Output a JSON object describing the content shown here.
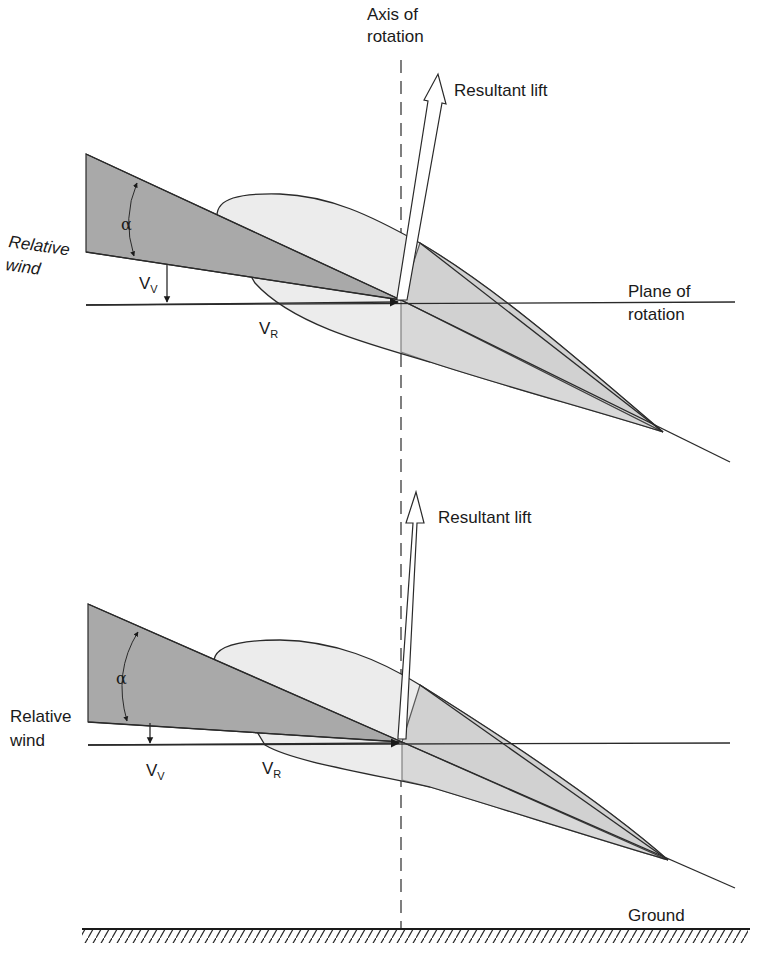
{
  "axis": {
    "label_line1": "Axis of",
    "label_line2": "rotation",
    "style": "dashed-vertical"
  },
  "top_diagram": {
    "lift_label": "Resultant lift",
    "relative_wind_line1": "Relative",
    "relative_wind_line2": "wind",
    "alpha_symbol": "α",
    "vv_base": "V",
    "vv_sub": "V",
    "vr_base": "V",
    "vr_sub": "R",
    "plane_label_line1": "Plane of",
    "plane_label_line2": "rotation"
  },
  "bottom_diagram": {
    "lift_label": "Resultant lift",
    "relative_wind_line1": "Relative",
    "relative_wind_line2": "wind",
    "alpha_symbol": "α",
    "vv_base": "V",
    "vv_sub": "V",
    "vr_base": "V",
    "vr_sub": "R",
    "ground_label": "Ground"
  },
  "colors": {
    "line": "#2a2a2a",
    "dark_wedge": "#a9a9a9",
    "mid_wedge": "#c8c8c8",
    "airfoil_fill": "#ececec",
    "background": "#ffffff"
  }
}
